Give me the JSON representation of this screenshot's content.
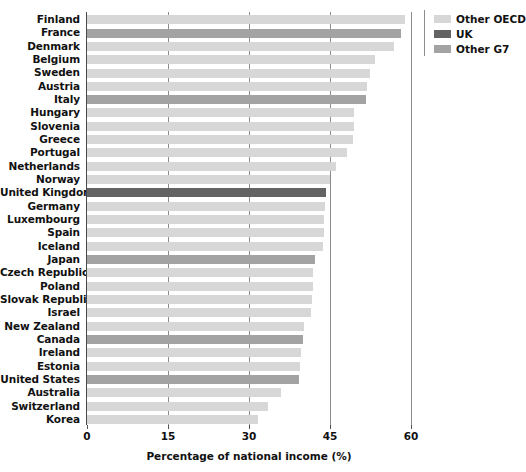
{
  "chart_data": {
    "type": "bar",
    "orientation": "horizontal",
    "title": "",
    "xlabel": "Percentage of national income (%)",
    "ylabel": "",
    "xlim": [
      0,
      60
    ],
    "xticks": [
      0,
      15,
      30,
      45,
      60
    ],
    "xticklabels": [
      "0",
      "15",
      "30",
      "45",
      "60"
    ],
    "grid": "vertical",
    "legend_position": "top-right",
    "legend": [
      {
        "label": "Other OECD",
        "color": "#d7d7d7"
      },
      {
        "label": "UK",
        "color": "#636363"
      },
      {
        "label": "Other G7",
        "color": "#a3a3a3"
      }
    ],
    "categories": [
      "Finland",
      "France",
      "Denmark",
      "Belgium",
      "Sweden",
      "Austria",
      "Italy",
      "Hungary",
      "Slovenia",
      "Greece",
      "Portugal",
      "Netherlands",
      "Norway",
      "United Kingdom",
      "Germany",
      "Luxembourg",
      "Spain",
      "Iceland",
      "Japan",
      "Czech Republic",
      "Poland",
      "Slovak Republic",
      "Israel",
      "New Zealand",
      "Canada",
      "Ireland",
      "Estonia",
      "United States",
      "Australia",
      "Switzerland",
      "Korea"
    ],
    "values": [
      58.8,
      58.1,
      56.8,
      53.3,
      52.4,
      51.9,
      51.7,
      49.5,
      49.4,
      49.3,
      48.2,
      46.1,
      45.0,
      44.2,
      44.0,
      43.9,
      43.8,
      43.7,
      42.3,
      41.9,
      41.8,
      41.6,
      41.5,
      40.2,
      40.0,
      39.6,
      39.5,
      39.2,
      36.0,
      33.5,
      31.6
    ],
    "group": [
      "Other OECD",
      "Other G7",
      "Other OECD",
      "Other OECD",
      "Other OECD",
      "Other OECD",
      "Other G7",
      "Other OECD",
      "Other OECD",
      "Other OECD",
      "Other OECD",
      "Other OECD",
      "Other OECD",
      "UK",
      "Other OECD",
      "Other OECD",
      "Other OECD",
      "Other OECD",
      "Other G7",
      "Other OECD",
      "Other OECD",
      "Other OECD",
      "Other OECD",
      "Other OECD",
      "Other G7",
      "Other OECD",
      "Other OECD",
      "Other G7",
      "Other OECD",
      "Other OECD",
      "Other OECD"
    ]
  },
  "colors": {
    "other_oecd": "#d7d7d7",
    "uk": "#636363",
    "other_g7": "#a3a3a3",
    "axis": "#4a4a4a",
    "gridline": "#8c8c8c",
    "text": "#111111",
    "background": "#ffffff"
  }
}
